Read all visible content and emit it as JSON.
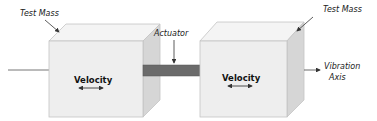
{
  "diagram": {
    "type": "two-mass actuator schematic",
    "labels": {
      "left_mass": "Test Mass",
      "right_mass": "Test Mass",
      "actuator": "Actuator",
      "vibration_axis_line1": "Vibration",
      "vibration_axis_line2": "Axis",
      "left_velocity": "Velocity",
      "right_velocity": "Velocity"
    },
    "colors": {
      "cube_front": "#eeeeee",
      "cube_top": "#f4f4f4",
      "cube_side": "#d6d6d6",
      "cube_edge": "#b8b8b8",
      "actuator_bar": "#6b6b6b",
      "line": "#555555"
    }
  }
}
